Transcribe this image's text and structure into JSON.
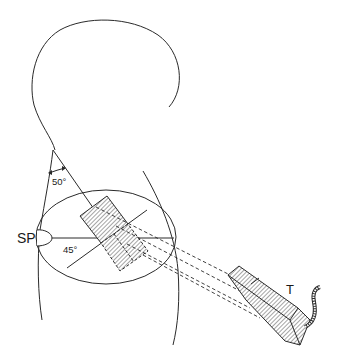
{
  "diagram": {
    "type": "anatomical-line-drawing",
    "labels": {
      "sp": "SP",
      "transducer": "T",
      "neck_angle": "50°",
      "probe_angle": "45°"
    },
    "elements": [
      {
        "name": "head-outline",
        "description": "Profile outline of head"
      },
      {
        "name": "neck-and-shoulder-contours",
        "description": "Neck and body contour lines"
      },
      {
        "name": "cross-section-ellipse",
        "description": "Elliptical cross-section of body"
      },
      {
        "name": "sp-marker",
        "description": "Semicircular marker labeled SP"
      },
      {
        "name": "hatched-image-plane",
        "description": "Hatched rectangle representing imaged region"
      },
      {
        "name": "dashed-projection-lines",
        "description": "Dashed lines projecting from transducer to plane"
      },
      {
        "name": "transducer",
        "description": "Hatched transducer probe with cable, labeled T"
      }
    ],
    "colors": {
      "stroke": "#2a2a2a",
      "hatch": "#555555",
      "background": "#ffffff"
    }
  }
}
